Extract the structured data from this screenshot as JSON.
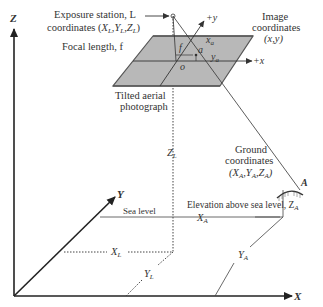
{
  "figure": {
    "labels": {
      "exposure_station_line1": "Exposure station, L",
      "exposure_station_line2": "coordinates (X",
      "exposure_coords_sub_L": "L",
      "exposure_coords_text": "coordinates (XL,YL,ZL)",
      "focal_length": "Focal length, f",
      "image_coordinates_line1": "Image",
      "image_coordinates_line2": "coordinates",
      "image_coordinates_line3": "(x,y)",
      "plus_y": "+y",
      "plus_x": "+x",
      "f_symbol": "f",
      "o_symbol": "o",
      "a_symbol": "a",
      "xa": "x",
      "ya": "y",
      "sub_a": "a",
      "tilted_line1": "Tilted aerial",
      "tilted_line2": "photograph",
      "zl": "Z",
      "sub_L": "L",
      "ground_line1": "Ground",
      "ground_line2": "coordinates",
      "ground_line3": "(XA,YA,ZA)",
      "point_A": "A",
      "elevation": "Elevation above sea level, Z",
      "sub_A": "A",
      "sea_level": "Sea level",
      "XA": "X",
      "YA": "Y",
      "XL": "X",
      "YL": "Y",
      "axis_Z": "Z",
      "axis_Y": "Y",
      "axis_X": "X"
    },
    "colors": {
      "line": "#333333",
      "plane_fill": "#b8b8b8",
      "plane_edge": "#555555",
      "text": "#333333"
    }
  }
}
